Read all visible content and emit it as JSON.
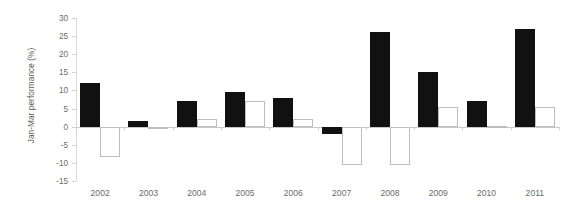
{
  "chart_data": {
    "type": "bar",
    "title": "",
    "xlabel": "",
    "ylabel": "Jan-Mar performance (%)",
    "categories": [
      "2002",
      "2003",
      "2004",
      "2005",
      "2006",
      "2007",
      "2008",
      "2009",
      "2010",
      "2011"
    ],
    "series": [
      {
        "name": "series-filled",
        "style": "filled-black",
        "color": "#111111",
        "values": [
          12,
          1.5,
          7,
          9.5,
          8,
          -2,
          26,
          15,
          7,
          27
        ]
      },
      {
        "name": "series-hollow",
        "style": "hollow-white",
        "color": "#ffffff",
        "border_color": "#bdbdbd",
        "values": [
          -8.5,
          -0.5,
          2,
          7,
          2,
          -10.5,
          -10.5,
          5.5,
          0.2,
          5.5
        ]
      }
    ],
    "ylim": [
      -15,
      30
    ],
    "yticks": [
      30,
      25,
      20,
      15,
      10,
      5,
      0,
      -5,
      -10,
      -15
    ],
    "ytick_labels": [
      "30",
      "25",
      "20",
      "15",
      "10",
      "5",
      "0",
      "-5",
      "-10",
      "-15"
    ],
    "grid": false,
    "legend": "none",
    "zero_line": true
  }
}
